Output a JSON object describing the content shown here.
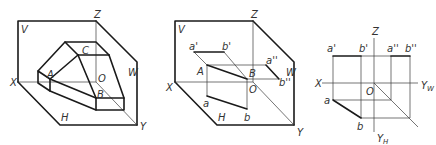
{
  "figures": [
    {
      "id": "solid-in-three-planes",
      "labels": {
        "V": "V",
        "W": "W",
        "H": "H",
        "X": "X",
        "Y": "Y",
        "Z": "Z",
        "O": "O",
        "A": "A",
        "B": "B",
        "C": "C"
      }
    },
    {
      "id": "line-ab-projections-pictorial",
      "labels": {
        "V": "V",
        "W": "W",
        "H": "H",
        "X": "X",
        "Y": "Y",
        "Z": "Z",
        "O": "O",
        "A": "A",
        "B": "B",
        "a_prime": "a'",
        "b_prime": "b'",
        "a_dprime": "a''",
        "b_dprime": "b''",
        "a": "a",
        "b": "b"
      }
    },
    {
      "id": "line-ab-orthographic-projection",
      "labels": {
        "X": "X",
        "Z": "Z",
        "O": "O",
        "Y_W": "Y",
        "Y_W_sub": "W",
        "Y_H": "Y",
        "Y_H_sub": "H",
        "a_prime": "a'",
        "b_prime": "b'",
        "a_dprime": "a''",
        "b_dprime": "b''",
        "a": "a",
        "b": "b"
      }
    }
  ],
  "colors": {
    "line": "#1a1a1a",
    "thin_line": "#3a3a3a",
    "text": "#333333",
    "background": "#ffffff"
  }
}
